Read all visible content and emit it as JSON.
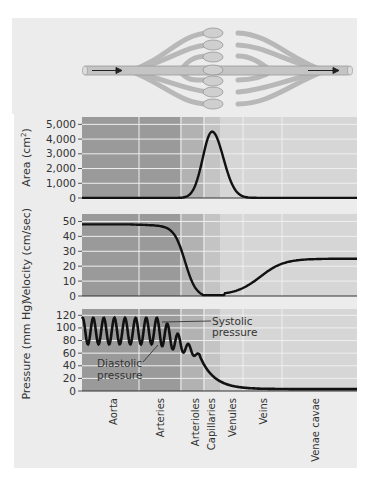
{
  "figure": {
    "diagram": {
      "description": "branching blood vessel diagram with flow arrows",
      "flow_direction": "left-to-right"
    },
    "regions": [
      "Aorta",
      "Arteries",
      "Arterioles",
      "Capillaries",
      "Venules",
      "Veins",
      "Venae cavae"
    ],
    "annotations": {
      "systolic": [
        "Systolic",
        "pressure"
      ],
      "diastolic": [
        "Diastolic",
        "pressure"
      ]
    },
    "colors": {
      "card": "#ececec",
      "band_dark": "#9a9a9a",
      "band_mid": "#b2b2b2",
      "band_midlight": "#c4c4c4",
      "band_light": "#d6d6d6",
      "grid": "#efefef",
      "curve": "#111111"
    }
  },
  "chart_data": [
    {
      "type": "line",
      "title": "",
      "ylabel": "Area (cm²)",
      "ylabel_main": "Area (cm",
      "ylabel_sup": "2",
      "ylabel_end": ")",
      "yticks": [
        "5,000",
        "4,000",
        "3,000",
        "2,000",
        "1,000",
        "0"
      ],
      "ytick_values": [
        5000,
        4000,
        3000,
        2000,
        1000,
        0
      ],
      "ylim": [
        0,
        5500
      ],
      "categories": [
        "Aorta",
        "Arteries",
        "Arterioles",
        "Capillaries",
        "Venules",
        "Veins",
        "Venae cavae"
      ],
      "values": [
        5,
        20,
        400,
        4500,
        300,
        50,
        10
      ],
      "grid": true
    },
    {
      "type": "line",
      "title": "",
      "ylabel": "Velocity (cm/sec)",
      "yticks": [
        "50",
        "40",
        "30",
        "20",
        "10",
        "0"
      ],
      "ytick_values": [
        50,
        40,
        30,
        20,
        10,
        0
      ],
      "ylim": [
        0,
        55
      ],
      "categories": [
        "Aorta",
        "Arteries",
        "Arterioles",
        "Capillaries",
        "Venules",
        "Veins",
        "Venae cavae"
      ],
      "values": [
        48,
        46,
        15,
        0.5,
        2,
        15,
        25
      ],
      "grid": true
    },
    {
      "type": "line",
      "title": "",
      "ylabel": "Pressure (mm Hg)",
      "yticks": [
        "120",
        "100",
        "80",
        "60",
        "40",
        "20",
        "0"
      ],
      "ytick_values": [
        120,
        100,
        80,
        60,
        40,
        20,
        0
      ],
      "ylim": [
        0,
        130
      ],
      "categories": [
        "Aorta",
        "Arteries",
        "Arterioles",
        "Capillaries",
        "Venules",
        "Veins",
        "Venae cavae"
      ],
      "series": [
        {
          "name": "Systolic pressure",
          "values": [
            118,
            112,
            70,
            35,
            18,
            8,
            3
          ]
        },
        {
          "name": "Diastolic pressure",
          "values": [
            75,
            75,
            55,
            35,
            18,
            8,
            3
          ]
        }
      ],
      "annotations": [
        "Systolic pressure",
        "Diastolic pressure"
      ],
      "grid": true
    }
  ]
}
